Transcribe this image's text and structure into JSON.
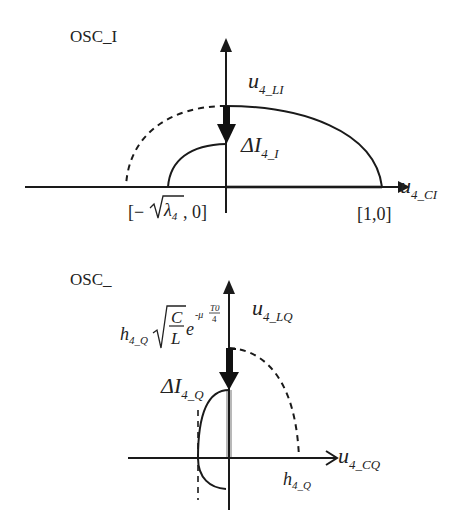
{
  "top_panel": {
    "title": "OSC_I",
    "vertical_axis_label": {
      "base": "u",
      "sub": "4_LI"
    },
    "horizontal_axis_label": {
      "base": "u",
      "sub": "4_CI"
    },
    "delta_label": {
      "base": "ΔI",
      "sub": "4_I"
    },
    "left_point_label": {
      "open": "[−",
      "sqrt": "λ",
      "sqrt_sub": "4",
      "close": ", 0]"
    },
    "right_point_label": "[1,0]"
  },
  "bottom_panel": {
    "title": "OSC_",
    "vertical_axis_label": {
      "base": "u",
      "sub": "4_LQ"
    },
    "horizontal_axis_label": {
      "base": "u",
      "sub": "4_CQ"
    },
    "delta_label": {
      "base": "ΔI",
      "sub": "4_Q"
    },
    "amplitude_label": {
      "h": "h",
      "h_sub": "4_Q",
      "num": "C",
      "den": "L",
      "e": "e",
      "exp": "-μ",
      "exp_num": "T0",
      "exp_den": "4"
    },
    "foot_label": {
      "base": "h",
      "sub": "4_Q"
    }
  },
  "colors": {
    "line": "#1a1a1a",
    "highlight": "#b8b8b8",
    "text": "#222222"
  }
}
